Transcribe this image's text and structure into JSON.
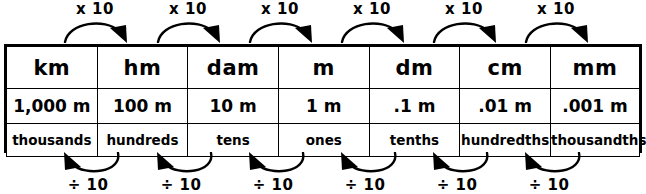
{
  "diagram": {
    "columns": [
      {
        "abbrev": "km",
        "value": "1,000 m",
        "place": "thousands"
      },
      {
        "abbrev": "hm",
        "value": "100 m",
        "place": "hundreds"
      },
      {
        "abbrev": "dam",
        "value": "10 m",
        "place": "tens"
      },
      {
        "abbrev": "m",
        "value": "1 m",
        "place": "ones"
      },
      {
        "abbrev": "dm",
        "value": ".1 m",
        "place": "tenths"
      },
      {
        "abbrev": "cm",
        "value": ".01 m",
        "place": "hundredths"
      },
      {
        "abbrev": "mm",
        "value": ".001 m",
        "place": "thousandths"
      }
    ],
    "top_operations": [
      {
        "label": "x 10"
      },
      {
        "label": "x 10"
      },
      {
        "label": "x 10"
      },
      {
        "label": "x 10"
      },
      {
        "label": "x 10"
      },
      {
        "label": "x 10"
      }
    ],
    "bottom_operations": [
      {
        "label": "÷ 10"
      },
      {
        "label": "÷ 10"
      },
      {
        "label": "÷ 10"
      },
      {
        "label": "÷ 10"
      },
      {
        "label": "÷ 10"
      },
      {
        "label": "÷ 10"
      }
    ],
    "colors": {
      "ink": "#000000",
      "background": "#ffffff"
    }
  }
}
